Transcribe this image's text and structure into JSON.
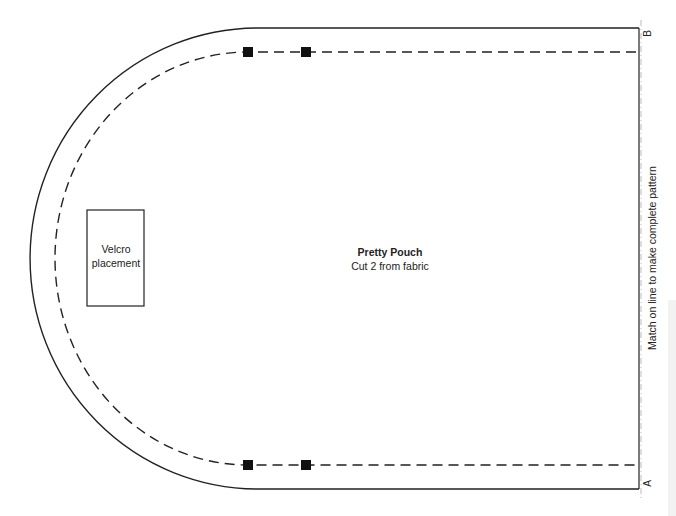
{
  "pattern": {
    "title": "Pretty Pouch",
    "instruction": "Cut 2 from fabric",
    "velcro_label": "Velcro placement",
    "velcro_line1": "Velcro",
    "velcro_line2": "placement",
    "match_line_text": "Match on line to make complete pattern",
    "point_top": "B",
    "point_bottom": "A"
  },
  "colors": {
    "line": "#222222",
    "background": "#ffffff"
  }
}
